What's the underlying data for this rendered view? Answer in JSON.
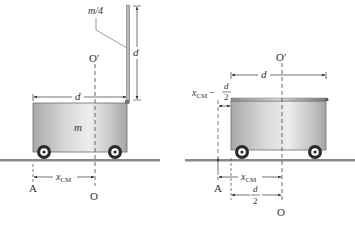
{
  "figure": {
    "left": {
      "labels": {
        "rod_mass": "m/4",
        "rod_length": "d",
        "cart_width": "d",
        "cart_mass": "m",
        "axis_top": "O′",
        "axis_bottom": "O",
        "point_a": "A",
        "xcm_main": "x",
        "xcm_sub": "CM"
      }
    },
    "right": {
      "labels": {
        "axis_top": "O′",
        "axis_bottom": "O",
        "cart_width": "d",
        "point_a": "A",
        "xcm_main": "x",
        "xcm_sub": "CM",
        "offset_main": "x",
        "offset_sub": "CM",
        "offset_minus": "−",
        "offset_num": "d",
        "offset_den": "2",
        "half_num": "d",
        "half_den": "2"
      }
    },
    "colors": {
      "cart_fill": "#b9b9b9",
      "cart_highlight": "#ececec",
      "ground": "#8a8a8a",
      "line": "#444444",
      "text": "#333333"
    }
  }
}
